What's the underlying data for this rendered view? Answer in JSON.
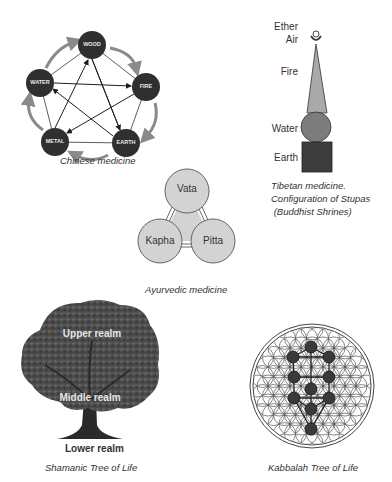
{
  "chinese": {
    "caption": "Chinese medicine",
    "elements": [
      {
        "label": "WOOD",
        "cx": 92,
        "cy": 45
      },
      {
        "label": "FIRE",
        "cx": 146,
        "cy": 87
      },
      {
        "label": "EARTH",
        "cx": 126,
        "cy": 143
      },
      {
        "label": "METAL",
        "cx": 55,
        "cy": 142
      },
      {
        "label": "WATER",
        "cx": 40,
        "cy": 83
      }
    ],
    "node_color": "#2f2f2f",
    "arrow_color": "#8a8a8a"
  },
  "tibetan": {
    "labels": {
      "ether": "Ether",
      "air": "Air",
      "fire": "Fire",
      "water": "Water",
      "earth": "Earth"
    },
    "caption_lines": [
      "Tibetan medicine.",
      "Configuration of Stupas",
      " (Buddhist Shrines)"
    ],
    "colors": {
      "fire": "#a9a9a9",
      "water": "#7c7c7c",
      "earth": "#3d3d3d"
    }
  },
  "ayurvedic": {
    "caption": "Ayurvedic medicine",
    "doshas": [
      {
        "label": "Vata",
        "cx": 187,
        "cy": 191
      },
      {
        "label": "Kapha",
        "cx": 160,
        "cy": 241
      },
      {
        "label": "Pitta",
        "cx": 213,
        "cy": 241
      }
    ],
    "fill": "#d3d3d3"
  },
  "shamanic": {
    "caption": "Shamanic Tree of Life",
    "realms": {
      "upper": "Upper realm",
      "middle": "Middle realm",
      "lower": "Lower realm"
    }
  },
  "kabbalah": {
    "caption": "Kabbalah Tree of Life",
    "sephirot": [
      {
        "x": 311,
        "y": 347
      },
      {
        "x": 293,
        "y": 357
      },
      {
        "x": 329,
        "y": 357
      },
      {
        "x": 294,
        "y": 377
      },
      {
        "x": 329,
        "y": 377
      },
      {
        "x": 311,
        "y": 389
      },
      {
        "x": 294,
        "y": 398
      },
      {
        "x": 329,
        "y": 398
      },
      {
        "x": 311,
        "y": 409
      },
      {
        "x": 311,
        "y": 429
      }
    ]
  }
}
